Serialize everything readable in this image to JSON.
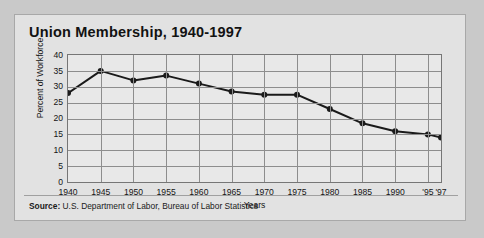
{
  "chart_data": {
    "type": "line",
    "title": "Union Membership, 1940-1997",
    "xlabel": "Years",
    "ylabel": "Percent of Workforce",
    "ylim": [
      0,
      40
    ],
    "ytick_step": 5,
    "yticks": [
      "40",
      "35",
      "30",
      "25",
      "20",
      "15",
      "10",
      "5",
      "0"
    ],
    "xticks": [
      "1940",
      "1945",
      "1950",
      "1955",
      "1960",
      "1965",
      "1970",
      "1975",
      "1980",
      "1985",
      "1990",
      "'95",
      "'97"
    ],
    "x": [
      1940,
      1945,
      1950,
      1955,
      1960,
      1965,
      1970,
      1975,
      1980,
      1985,
      1990,
      1995,
      1997
    ],
    "values": [
      28,
      35,
      32,
      33.5,
      31,
      28.5,
      27.5,
      27.5,
      23,
      18.5,
      16,
      15,
      14
    ],
    "grid": true,
    "legend": "none",
    "series_color": "#1a1a1a",
    "marker": "circle"
  },
  "source": {
    "label": "Source:",
    "text": " U.S. Department of Labor, Bureau of Labor Statistics"
  },
  "colors": {
    "panel_bg": "#e2e2e2",
    "plot_bg": "#e8e8e8",
    "grid": "#8d8d8d",
    "axis": "#767676",
    "ink": "#121212"
  }
}
